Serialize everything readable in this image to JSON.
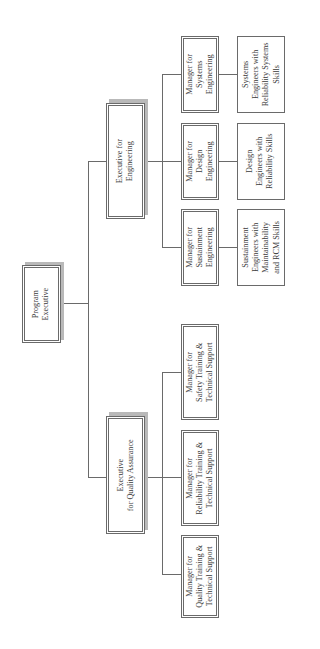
{
  "chart_title": "",
  "nodes": {
    "program_executive": {
      "label": "Program\nExecutive"
    },
    "exec_engineering": {
      "label": "Executive for\nEngineering"
    },
    "exec_quality": {
      "label": "Executive\nfor Quality Assurance"
    },
    "mgr_systems": {
      "label": "Manager for\nSystems\nEngineering"
    },
    "mgr_design": {
      "label": "Manager for\nDesign\nEngineering"
    },
    "mgr_sustainment": {
      "label": "Manager for\nSustainment\nEngineering"
    },
    "eng_systems": {
      "label": "Systems\nEngineers with\nReliability Systems\nSkills"
    },
    "eng_design": {
      "label": "Design\nEngineers with\nReliability Skills"
    },
    "eng_sustainment": {
      "label": "Sustainment\nEngineers with\nMaintainability\nand RCM Skills"
    },
    "mgr_safety": {
      "label": "Manager for\nSafety Training &\nTechnical Support"
    },
    "mgr_reliability": {
      "label": "Manager for\nReliability Training &\nTechnical Support"
    },
    "mgr_quality": {
      "label": "Manager for\nQuality Training &\nTechnical Support"
    }
  },
  "colors": {
    "line": "#6a6a6a",
    "shadow": "#b9b9b9",
    "text": "#3a3a3a"
  }
}
